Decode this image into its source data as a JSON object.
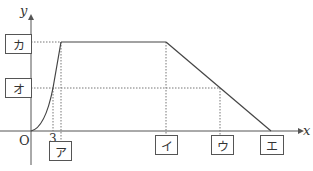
{
  "diagram": {
    "axes": {
      "x_label": "x",
      "y_label": "y",
      "origin_label": "O",
      "x_tick_label": "3"
    },
    "boxes": {
      "ka": "カ",
      "o": "オ",
      "a": "ア",
      "i": "イ",
      "u": "ウ",
      "e": "エ"
    },
    "graph_description": "Curve rising from origin to the level カ at x=ア, horizontal plateau until x=イ, then linear decrease reaching 0 at x=エ; point on decreasing line at level オ has x=ウ; curve reaches level オ at x=3",
    "colors": {
      "line": "#555555",
      "dotted": "#777777",
      "box_border": "#555555"
    }
  }
}
